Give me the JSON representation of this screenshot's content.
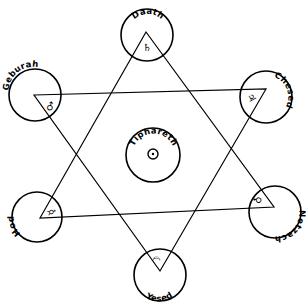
{
  "diagram": {
    "sephiroth": [
      {
        "id": "daath",
        "label": "Daath",
        "planet": "Saturn",
        "symbol": "♄"
      },
      {
        "id": "geburah",
        "label": "Geburah",
        "planet": "Mars",
        "symbol": "♂"
      },
      {
        "id": "chesed",
        "label": "Chesed",
        "planet": "Jupiter",
        "symbol": "♃"
      },
      {
        "id": "tiphareth",
        "label": "Tiphareth",
        "planet": "Sun",
        "symbol": "☉"
      },
      {
        "id": "hod",
        "label": "Hod",
        "planet": "Mercury",
        "symbol": "☿"
      },
      {
        "id": "netzach",
        "label": "Netzach",
        "planet": "Venus",
        "symbol": "♀"
      },
      {
        "id": "yesod",
        "label": "Yesed",
        "planet": "Moon",
        "symbol": "☽"
      }
    ],
    "colors": {
      "ink": "#000000",
      "paper": "#ffffff"
    }
  }
}
